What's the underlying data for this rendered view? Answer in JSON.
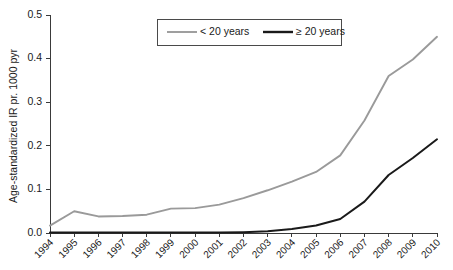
{
  "chart_data": {
    "type": "line",
    "title": "",
    "xlabel": "",
    "ylabel": "Age-standardized IR pr. 1000 pyr",
    "x": [
      1994,
      1995,
      1996,
      1997,
      1998,
      1999,
      2000,
      2001,
      2002,
      2003,
      2004,
      2005,
      2006,
      2007,
      2008,
      2009,
      2010
    ],
    "categories": [
      "1994",
      "1995",
      "1996",
      "1997",
      "1998",
      "1999",
      "2000",
      "2001",
      "2002",
      "2003",
      "2004",
      "2005",
      "2006",
      "2007",
      "2008",
      "2009",
      "2010"
    ],
    "xlim": [
      1994,
      2010
    ],
    "ylim": [
      0.0,
      0.5
    ],
    "ytick_labels": [
      "0.0",
      "0.1",
      "0.2",
      "0.3",
      "0.4",
      "0.5"
    ],
    "ytick_values": [
      0.0,
      0.1,
      0.2,
      0.3,
      0.4,
      0.5
    ],
    "grid": false,
    "legend_position": "top-center",
    "series": [
      {
        "name": "< 20 years",
        "color": "#9a9a9a",
        "values": [
          0.017,
          0.05,
          0.038,
          0.039,
          0.042,
          0.056,
          0.057,
          0.065,
          0.08,
          0.098,
          0.118,
          0.14,
          0.178,
          0.258,
          0.36,
          0.398,
          0.45
        ]
      },
      {
        "name": "≥ 20 years",
        "color": "#1a1a1a",
        "values": [
          0.001,
          0.001,
          0.001,
          0.001,
          0.001,
          0.001,
          0.001,
          0.001,
          0.002,
          0.004,
          0.009,
          0.017,
          0.032,
          0.072,
          0.133,
          0.172,
          0.215
        ]
      }
    ]
  },
  "legend": {
    "items": [
      {
        "label": "< 20 years",
        "color": "#9a9a9a"
      },
      {
        "label": "≥ 20 years",
        "color": "#1a1a1a"
      }
    ]
  },
  "axes": {
    "y_title": "Age-standardized IR pr. 1000 pyr"
  }
}
